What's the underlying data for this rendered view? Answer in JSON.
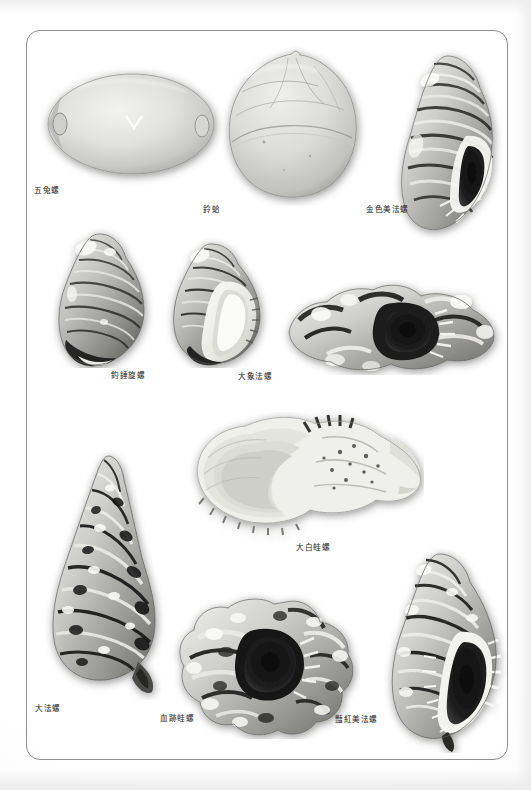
{
  "document": {
    "type": "book-plate",
    "page_background": "#ffffff",
    "frame_color": "#8d8f92",
    "caption_color": "#3a3a3a",
    "color_mode": "grayscale"
  },
  "plate": {
    "specimens": [
      {
        "id": "specimen-1",
        "label": "五兔螺",
        "shape": "cowrie",
        "row": 1,
        "column": 1,
        "caption_position": "below-left"
      },
      {
        "id": "specimen-2",
        "label": "鈴蛤",
        "shape": "globular-bivalve",
        "row": 1,
        "column": 2,
        "caption_position": "below-left"
      },
      {
        "id": "specimen-3",
        "label": "金色美法螺",
        "shape": "ribbed-triton",
        "row": 1,
        "column": 3,
        "caption_position": "left"
      },
      {
        "id": "specimen-4",
        "label": "釣錘旋螺",
        "shape": "ribbed-whelk",
        "row": 2,
        "column": 1,
        "caption_position": "below-right"
      },
      {
        "id": "specimen-5",
        "label": "大象法螺",
        "shape": "knobbed-triton",
        "row": 2,
        "column": 2,
        "caption_position": "below-left"
      },
      {
        "id": "specimen-6",
        "label": "大白蛙螺",
        "shape": "frog-shell-aperture",
        "row": 3,
        "column": 2,
        "caption_position": "below-right"
      },
      {
        "id": "specimen-7",
        "label": "大法螺",
        "shape": "trumpet-triton",
        "row": 3,
        "column": 1,
        "caption_position": "below-right"
      },
      {
        "id": "specimen-8",
        "label": "血跡蛙螺",
        "shape": "nodulose-frog-shell",
        "row": 4,
        "column": 2,
        "caption_position": "below-left"
      },
      {
        "id": "specimen-9",
        "label": "豔紅美法螺",
        "shape": "banded-triton",
        "row": 4,
        "column": 3,
        "caption_position": "below-left"
      }
    ]
  }
}
